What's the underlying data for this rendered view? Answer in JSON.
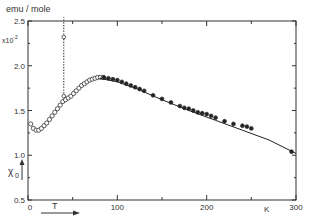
{
  "chart_data": {
    "type": "scatter",
    "title": "",
    "ylabel_units": "emu / mole",
    "y_multiplier": "x10^-2",
    "ylabel": "χ0",
    "xlabel": "T",
    "xlabel_unit": "K",
    "xlim": [
      0,
      300
    ],
    "ylim": [
      0.5,
      2.5
    ],
    "x_ticks": [
      0,
      100,
      200,
      300
    ],
    "x_tick_labels": [
      "0",
      "100",
      "200",
      "300"
    ],
    "y_ticks": [
      0.5,
      1.0,
      1.5,
      2.0,
      2.5
    ],
    "y_tick_labels": [
      "0.5",
      "1.0",
      "1.5",
      "2.0",
      "2.5"
    ],
    "grid": false,
    "series": [
      {
        "name": "open circles (low T)",
        "marker": "open-circle",
        "x": [
          3,
          6,
          9,
          12,
          15,
          18,
          21,
          24,
          27,
          30,
          33,
          36,
          39,
          42,
          45,
          48,
          51,
          54,
          57,
          60,
          63,
          66,
          69,
          72,
          75,
          78,
          81,
          84
        ],
        "y": [
          1.35,
          1.3,
          1.28,
          1.28,
          1.3,
          1.33,
          1.36,
          1.4,
          1.44,
          1.48,
          1.52,
          1.56,
          1.6,
          1.62,
          1.64,
          1.66,
          1.69,
          1.72,
          1.75,
          1.78,
          1.8,
          1.82,
          1.84,
          1.85,
          1.86,
          1.87,
          1.87,
          1.87
        ]
      },
      {
        "name": "dotted vertical (transition)",
        "marker": "dot",
        "x": [
          40,
          40,
          40,
          40,
          40,
          40,
          40,
          40,
          40,
          40
        ],
        "y": [
          1.66,
          1.75,
          1.85,
          1.95,
          2.05,
          2.15,
          2.25,
          2.35,
          2.45,
          2.5
        ]
      },
      {
        "name": "filled circles (high T)",
        "marker": "filled-circle",
        "x": [
          85,
          90,
          95,
          100,
          105,
          110,
          115,
          120,
          125,
          130,
          140,
          150,
          160,
          170,
          175,
          180,
          185,
          190,
          195,
          200,
          205,
          210,
          220,
          230,
          240,
          245,
          250,
          295
        ],
        "y": [
          1.87,
          1.86,
          1.85,
          1.84,
          1.82,
          1.8,
          1.78,
          1.76,
          1.74,
          1.72,
          1.67,
          1.63,
          1.59,
          1.55,
          1.53,
          1.52,
          1.5,
          1.48,
          1.47,
          1.46,
          1.44,
          1.42,
          1.38,
          1.35,
          1.33,
          1.32,
          1.3,
          1.04
        ]
      },
      {
        "name": "fit curve",
        "marker": "line",
        "x": [
          80,
          100,
          120,
          150,
          180,
          210,
          240,
          270,
          300
        ],
        "y": [
          1.86,
          1.82,
          1.75,
          1.62,
          1.5,
          1.39,
          1.28,
          1.17,
          1.02
        ]
      }
    ]
  },
  "labels": {
    "units": "emu / mole",
    "multiplier": "x10",
    "multiplier_exp": "-2",
    "chi": "χ",
    "chi_sub": "0",
    "t": "T",
    "k": "K"
  }
}
